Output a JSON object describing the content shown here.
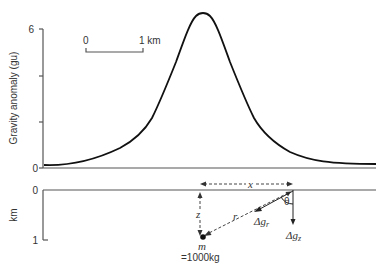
{
  "upper_panel": {
    "ylabel": "Gravity anomaly (gu)",
    "y_ticks": [
      {
        "label": "6",
        "value": 6
      },
      {
        "label": "",
        "value": 4
      },
      {
        "label": "",
        "value": 2
      },
      {
        "label": "0",
        "value": 0
      }
    ],
    "scale_bar": {
      "start_label": "0",
      "end_label": "1 km"
    },
    "curve_description": "Symmetric bell-shaped gravity anomaly peaking above the buried mass",
    "peak_value_gu": 6.5
  },
  "lower_panel": {
    "ylabel": "km",
    "y_ticks": [
      {
        "label": "0",
        "value": 0
      },
      {
        "label": "1",
        "value": 1
      }
    ],
    "labels": {
      "x": "x",
      "z": "z",
      "r": "r",
      "theta": "θ",
      "dg_r_main": "Δg",
      "dg_r_sub": "r",
      "dg_z_main": "Δg",
      "dg_z_sub": "z",
      "mass_symbol": "m",
      "mass_value": "=1000kg"
    }
  }
}
